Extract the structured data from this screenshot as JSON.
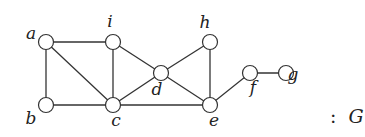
{
  "diagram": {
    "type": "undirected-graph",
    "caption_prefix": ":",
    "caption_name": "G",
    "nodes": [
      {
        "id": "a",
        "label": "a",
        "x": 46,
        "y": 42,
        "lx": 31,
        "ly": 39
      },
      {
        "id": "i",
        "label": "i",
        "x": 113,
        "y": 42,
        "lx": 110,
        "ly": 27
      },
      {
        "id": "b",
        "label": "b",
        "x": 46,
        "y": 105,
        "lx": 31,
        "ly": 124
      },
      {
        "id": "c",
        "label": "c",
        "x": 113,
        "y": 105,
        "lx": 116,
        "ly": 126
      },
      {
        "id": "d",
        "label": "d",
        "x": 161,
        "y": 73,
        "lx": 157,
        "ly": 95
      },
      {
        "id": "h",
        "label": "h",
        "x": 210,
        "y": 42,
        "lx": 205,
        "ly": 28
      },
      {
        "id": "e",
        "label": "e",
        "x": 210,
        "y": 105,
        "lx": 214,
        "ly": 126
      },
      {
        "id": "f",
        "label": "f",
        "x": 250,
        "y": 73,
        "lx": 253,
        "ly": 93
      },
      {
        "id": "g",
        "label": "g",
        "x": 286,
        "y": 73,
        "lx": 293,
        "ly": 80
      }
    ],
    "edges": [
      [
        "a",
        "i"
      ],
      [
        "a",
        "b"
      ],
      [
        "a",
        "c"
      ],
      [
        "i",
        "c"
      ],
      [
        "i",
        "d"
      ],
      [
        "b",
        "c"
      ],
      [
        "c",
        "d"
      ],
      [
        "c",
        "e"
      ],
      [
        "d",
        "h"
      ],
      [
        "d",
        "e"
      ],
      [
        "h",
        "e"
      ],
      [
        "e",
        "f"
      ],
      [
        "f",
        "g"
      ]
    ],
    "node_radius": 7.5,
    "caption_pos": {
      "x": 330,
      "y": 123
    }
  }
}
